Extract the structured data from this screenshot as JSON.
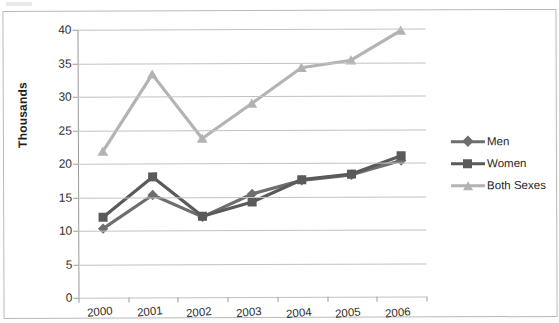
{
  "chart_data": {
    "type": "line",
    "title": "",
    "xlabel": "",
    "ylabel": "Thousands",
    "categories": [
      "2000",
      "2001",
      "2002",
      "2003",
      "2004",
      "2005",
      "2006"
    ],
    "ylim": [
      0,
      40
    ],
    "ytick_step": 5,
    "yticks": [
      "0",
      "5",
      "10",
      "15",
      "20",
      "25",
      "30",
      "35",
      "40"
    ],
    "grid": true,
    "legend_position": "right",
    "series": [
      {
        "name": "Men",
        "marker": "diamond",
        "color": "#6e6e6e",
        "values": [
          10.3,
          15.3,
          12.0,
          15.4,
          17.4,
          18.2,
          20.3
        ]
      },
      {
        "name": "Women",
        "marker": "square",
        "color": "#5a5a5a",
        "values": [
          12.0,
          18.0,
          12.1,
          14.2,
          17.5,
          18.3,
          21.0
        ]
      },
      {
        "name": "Both Sexes",
        "marker": "triangle",
        "color": "#b3b3b3",
        "values": [
          21.8,
          33.3,
          23.7,
          28.9,
          34.2,
          35.3,
          39.7
        ]
      }
    ]
  },
  "legend": {
    "items": [
      {
        "label": "Men"
      },
      {
        "label": "Women"
      },
      {
        "label": "Both Sexes"
      }
    ]
  }
}
